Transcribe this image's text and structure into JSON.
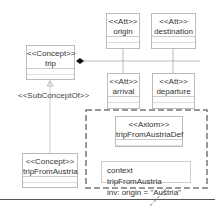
{
  "concepts": [
    {
      "stereotype": "<<Concept>>",
      "name": "trip"
    },
    {
      "stereotype": "<<Concept>>",
      "name": "tripFromAustria"
    }
  ],
  "attributes": [
    {
      "stereotype": "<<Att>>",
      "name": "origin"
    },
    {
      "stereotype": "<<Att>>",
      "name": "destination"
    },
    {
      "stereotype": "<<Att>>",
      "name": "arrival"
    },
    {
      "stereotype": "<<Att>>",
      "name": "departure"
    }
  ],
  "axiom": {
    "stereotype": "<<Axiom>>",
    "name": "tripFromAustriaDef"
  },
  "relations": {
    "subconcept_label": "<<SubConceptOf>>"
  },
  "note": {
    "line1": "context tripFromAustria",
    "line2": "inv: origin = \"Austria\""
  }
}
